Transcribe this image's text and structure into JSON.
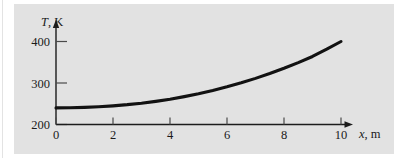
{
  "figure": {
    "background_color": "#ffffff",
    "panel_color": "#e2e2e2",
    "curve_color": "#121212",
    "axis_color": "#1c1c1c"
  },
  "chart_data": {
    "type": "line",
    "title": "",
    "xlabel": "x, m",
    "xlabel_symbol": "x",
    "xlabel_unit": ", m",
    "ylabel": "T, K",
    "ylabel_symbol": "T",
    "ylabel_unit": ", K",
    "xlim": [
      0,
      10
    ],
    "ylim": [
      200,
      420
    ],
    "grid": false,
    "legend": false,
    "xticks": [
      0,
      2,
      4,
      6,
      8,
      10
    ],
    "xtick_labels": [
      "0",
      "2",
      "4",
      "6",
      "8",
      "10"
    ],
    "yticks": [
      200,
      300,
      400
    ],
    "ytick_labels": [
      "200",
      "300",
      "400"
    ],
    "x": [
      0,
      0.5,
      1,
      1.5,
      2,
      2.5,
      3,
      3.5,
      4,
      4.5,
      5,
      5.5,
      6,
      6.5,
      7,
      7.5,
      8,
      8.5,
      9,
      9.5,
      10
    ],
    "values": [
      240,
      240.4,
      241.3,
      242.8,
      245,
      247.8,
      251.4,
      255.8,
      261,
      267.1,
      274,
      281.9,
      290.7,
      300.4,
      311.1,
      322.8,
      335.5,
      349.2,
      363.9,
      381.4,
      400
    ],
    "series": [
      {
        "name": "T(x)",
        "values": [
          240,
          240.4,
          241.3,
          242.8,
          245,
          247.8,
          251.4,
          255.8,
          261,
          267.1,
          274,
          281.9,
          290.7,
          300.4,
          311.1,
          322.8,
          335.5,
          349.2,
          363.9,
          381.4,
          400
        ]
      }
    ],
    "annotations": []
  }
}
